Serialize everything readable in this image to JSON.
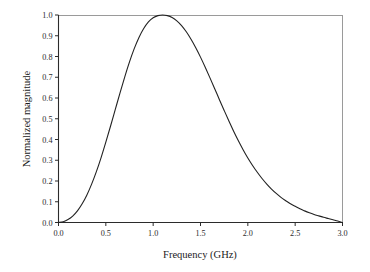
{
  "figure": {
    "background_color": "#ffffff",
    "frame_color_major": "#2b2b2b",
    "frame_color_minor": "#9a9a9a",
    "curve_color": "#222222"
  },
  "chart_data": {
    "type": "line",
    "title": "",
    "subtitle": "",
    "xlabel": "Frequency (GHz)",
    "ylabel": "Normalized magnitude",
    "xlim": [
      0.0,
      3.0
    ],
    "ylim": [
      0.0,
      1.0
    ],
    "grid": false,
    "legend": null,
    "legend_position": "none",
    "xticks": [
      0.0,
      0.5,
      1.0,
      1.5,
      2.0,
      2.5,
      3.0
    ],
    "xtick_labels": [
      "0.0",
      "0.5",
      "1.0",
      "1.5",
      "2.0",
      "2.5",
      "3.0"
    ],
    "yticks": [
      0.0,
      0.1,
      0.2,
      0.3,
      0.4,
      0.5,
      0.6,
      0.7,
      0.8,
      0.9,
      1.0
    ],
    "ytick_labels": [
      "0.0",
      "0.1",
      "0.2",
      "0.3",
      "0.4",
      "0.5",
      "0.6",
      "0.7",
      "0.8",
      "0.9",
      "1.0"
    ],
    "series": [
      {
        "name": "Normalized magnitude",
        "color": "#222222",
        "line_width": 1.1,
        "x": [
          0.0,
          0.05,
          0.1,
          0.15,
          0.2,
          0.25,
          0.3,
          0.35,
          0.4,
          0.45,
          0.5,
          0.55,
          0.6,
          0.65,
          0.7,
          0.75,
          0.8,
          0.85,
          0.9,
          0.95,
          1.0,
          1.05,
          1.1,
          1.15,
          1.2,
          1.25,
          1.3,
          1.35,
          1.4,
          1.45,
          1.5,
          1.55,
          1.6,
          1.65,
          1.7,
          1.75,
          1.8,
          1.85,
          1.9,
          1.95,
          2.0,
          2.05,
          2.1,
          2.15,
          2.2,
          2.25,
          2.3,
          2.35,
          2.4,
          2.45,
          2.5,
          2.55,
          2.6,
          2.65,
          2.7,
          2.75,
          2.8,
          2.85,
          2.9,
          2.95,
          3.0
        ],
        "y": [
          0.0,
          0.004,
          0.014,
          0.031,
          0.056,
          0.09,
          0.133,
          0.185,
          0.245,
          0.313,
          0.387,
          0.465,
          0.545,
          0.625,
          0.702,
          0.774,
          0.838,
          0.892,
          0.935,
          0.967,
          0.987,
          0.997,
          1.0,
          0.997,
          0.988,
          0.972,
          0.949,
          0.919,
          0.883,
          0.842,
          0.797,
          0.748,
          0.697,
          0.645,
          0.592,
          0.54,
          0.489,
          0.44,
          0.394,
          0.351,
          0.311,
          0.275,
          0.242,
          0.212,
          0.185,
          0.161,
          0.14,
          0.121,
          0.105,
          0.09,
          0.078,
          0.066,
          0.056,
          0.047,
          0.039,
          0.032,
          0.025,
          0.019,
          0.013,
          0.007,
          0.0
        ]
      }
    ],
    "annotations": [],
    "peak": {
      "x": 1.1,
      "y": 1.0
    },
    "half_maximum_points": [
      0.46,
      1.73
    ]
  }
}
